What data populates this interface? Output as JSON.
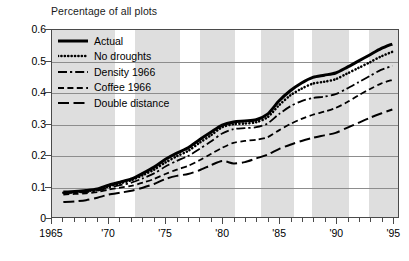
{
  "chart_data": {
    "type": "line",
    "title": "Percentage of all plots",
    "xlabel": "",
    "ylabel": "Percentage of all plots",
    "xlim": [
      1965,
      1995.5
    ],
    "ylim": [
      0,
      0.6
    ],
    "grid": true,
    "legend_position": "top-left",
    "y_ticks": [
      "0.6",
      "0.5",
      "0.4",
      "0.3",
      "0.2",
      "0.1",
      "0"
    ],
    "y_tick_values": [
      0.6,
      0.5,
      0.4,
      0.3,
      0.2,
      0.1,
      0
    ],
    "x_ticks": [
      "1965",
      "'70",
      "'75",
      "'80",
      "'85",
      "'90",
      "'95"
    ],
    "x_tick_values": [
      1965,
      1970,
      1975,
      1980,
      1985,
      1990,
      1995
    ],
    "x_minor_step": 1,
    "shaded_bands": [
      [
        1965,
        1970.5
      ],
      [
        1972.3,
        1976.2
      ],
      [
        1978.0,
        1981.0
      ],
      [
        1983.3,
        1986.2
      ],
      [
        1987.8,
        1991.0
      ],
      [
        1992.8,
        1995.5
      ]
    ],
    "x": [
      1966,
      1967,
      1968,
      1969,
      1970,
      1971,
      1972,
      1973,
      1974,
      1975,
      1976,
      1977,
      1978,
      1979,
      1980,
      1981,
      1982,
      1983,
      1984,
      1985,
      1986,
      1987,
      1988,
      1989,
      1990,
      1991,
      1992,
      1993,
      1994,
      1995
    ],
    "series": [
      {
        "name": "Actual",
        "style": "solid",
        "values": [
          0.08,
          0.082,
          0.085,
          0.09,
          0.102,
          0.112,
          0.122,
          0.14,
          0.16,
          0.185,
          0.205,
          0.222,
          0.248,
          0.272,
          0.295,
          0.305,
          0.308,
          0.312,
          0.33,
          0.372,
          0.405,
          0.43,
          0.448,
          0.455,
          0.462,
          0.48,
          0.5,
          0.52,
          0.54,
          0.555
        ]
      },
      {
        "name": "No droughts",
        "style": "dotted",
        "values": [
          0.078,
          0.08,
          0.083,
          0.088,
          0.098,
          0.108,
          0.118,
          0.134,
          0.152,
          0.175,
          0.195,
          0.212,
          0.238,
          0.262,
          0.288,
          0.298,
          0.3,
          0.304,
          0.32,
          0.358,
          0.39,
          0.412,
          0.428,
          0.434,
          0.442,
          0.46,
          0.478,
          0.496,
          0.515,
          0.53
        ]
      },
      {
        "name": "Density 1966",
        "style": "dash-dot",
        "values": [
          0.076,
          0.078,
          0.08,
          0.084,
          0.094,
          0.102,
          0.11,
          0.124,
          0.14,
          0.162,
          0.18,
          0.196,
          0.218,
          0.242,
          0.268,
          0.282,
          0.285,
          0.288,
          0.3,
          0.33,
          0.355,
          0.372,
          0.382,
          0.386,
          0.394,
          0.412,
          0.432,
          0.452,
          0.472,
          0.485
        ]
      },
      {
        "name": "Coffee 1966",
        "style": "short-dash",
        "values": [
          0.072,
          0.074,
          0.076,
          0.08,
          0.088,
          0.094,
          0.1,
          0.11,
          0.122,
          0.138,
          0.152,
          0.164,
          0.182,
          0.202,
          0.222,
          0.238,
          0.244,
          0.248,
          0.256,
          0.278,
          0.298,
          0.315,
          0.328,
          0.338,
          0.35,
          0.368,
          0.39,
          0.41,
          0.428,
          0.44
        ]
      },
      {
        "name": "Double distance",
        "style": "long-dash",
        "values": [
          0.048,
          0.05,
          0.054,
          0.062,
          0.072,
          0.078,
          0.084,
          0.094,
          0.106,
          0.122,
          0.132,
          0.138,
          0.15,
          0.166,
          0.18,
          0.172,
          0.176,
          0.188,
          0.2,
          0.218,
          0.232,
          0.244,
          0.254,
          0.262,
          0.27,
          0.286,
          0.302,
          0.318,
          0.332,
          0.345
        ]
      }
    ]
  },
  "legend": {
    "items": [
      {
        "label": "Actual",
        "style": "solid"
      },
      {
        "label": "No droughts",
        "style": "dotted"
      },
      {
        "label": "Density 1966",
        "style": "dash-dot"
      },
      {
        "label": "Coffee 1966",
        "style": "short-dash"
      },
      {
        "label": "Double distance",
        "style": "long-dash"
      }
    ]
  }
}
